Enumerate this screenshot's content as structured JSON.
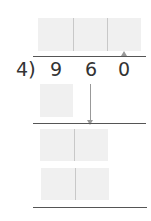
{
  "problem": {
    "divisor": "4",
    "bracket": ")",
    "dividend_digits": [
      "9",
      "6",
      "0"
    ]
  },
  "colors": {
    "box_fill": "#f0f0f0",
    "divider": "#c8c8c8",
    "rule_line": "#555555",
    "digit_text": "#333333",
    "arrow": "#999999"
  },
  "layout": {
    "quotient_boxes": 3,
    "product_boxes_row1": 1,
    "remainder_boxes_row2": 2,
    "product_boxes_row3": 2
  }
}
